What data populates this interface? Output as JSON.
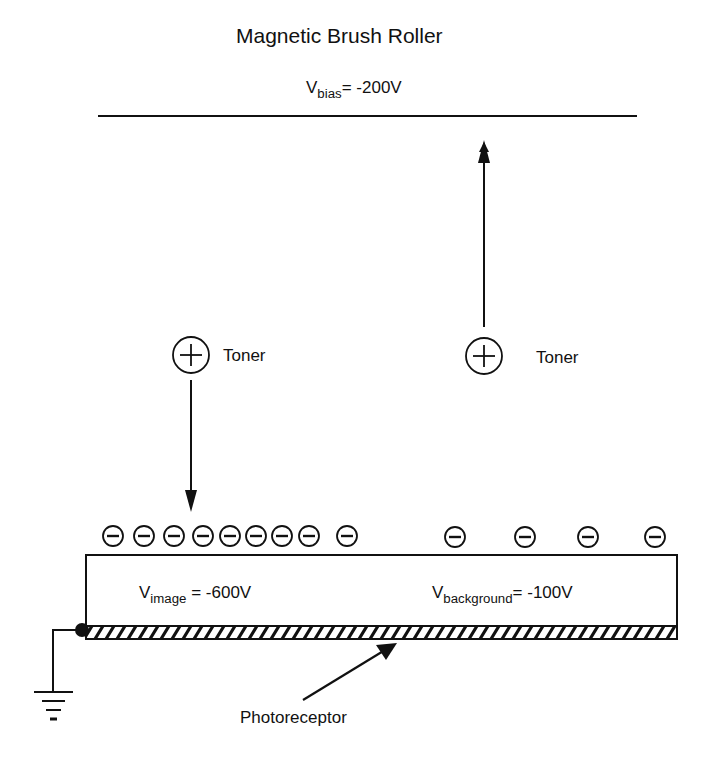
{
  "title": "Magnetic Brush Roller",
  "bias": {
    "symbol": "V",
    "subscript": "bias",
    "value": "= -200V"
  },
  "toner_left": {
    "symbol": "+",
    "label": "Toner"
  },
  "toner_right": {
    "symbol": "+",
    "label": "Toner"
  },
  "image_region": {
    "symbol": "V",
    "subscript": "image",
    "value": " = -600V"
  },
  "background_region": {
    "symbol": "V",
    "subscript": "background",
    "value": "= -100V"
  },
  "photoreceptor_label": "Photoreceptor",
  "charges": {
    "symbol": "−",
    "image_count": 9,
    "background_count": 4
  },
  "colors": {
    "ink": "#111111",
    "background": "#ffffff"
  }
}
